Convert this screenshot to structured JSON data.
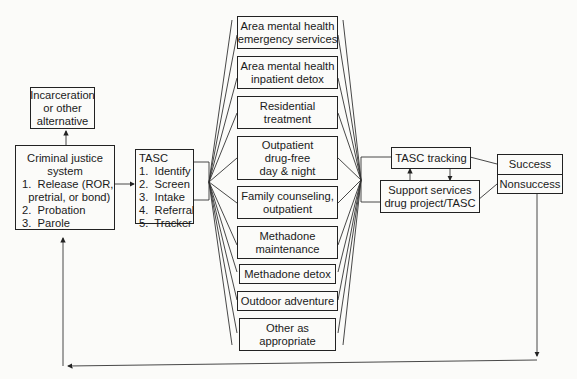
{
  "diagram": {
    "incarceration": {
      "lines": [
        "Incarceration",
        "or other",
        "alternative"
      ]
    },
    "criminal_justice": {
      "title_lines": [
        "Criminal justice",
        "system"
      ],
      "items": [
        "1.  Release (ROR,",
        "  pretrial, or bond)",
        "2.  Probation",
        "3.  Parole"
      ]
    },
    "tasc": {
      "title": "TASC",
      "items": [
        "1.  Identify",
        "2.  Screen",
        "3.  Intake",
        "4.  Referral",
        "5.  Tracker"
      ]
    },
    "services": [
      {
        "lines": [
          "Area mental health",
          "emergency services"
        ]
      },
      {
        "lines": [
          "Area mental health",
          "inpatient detox"
        ]
      },
      {
        "lines": [
          "Residential",
          "treatment"
        ]
      },
      {
        "lines": [
          "Outpatient",
          "drug-free",
          "day & night"
        ]
      },
      {
        "lines": [
          "Family counseling,",
          "outpatient"
        ]
      },
      {
        "lines": [
          "Methadone",
          "maintenance"
        ]
      },
      {
        "lines": [
          "Methadone detox"
        ]
      },
      {
        "lines": [
          "Outdoor adventure"
        ]
      },
      {
        "lines": [
          "Other as",
          "appropriate"
        ]
      }
    ],
    "tasc_tracking": {
      "label": "TASC tracking"
    },
    "support_services": {
      "lines": [
        "Support services",
        "drug project/TASC"
      ]
    },
    "outcomes": {
      "success": "Success",
      "nonsuccess": "Nonsuccess"
    }
  }
}
